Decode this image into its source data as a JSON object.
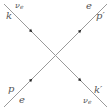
{
  "diagram": {
    "type": "feynman-diagram",
    "title": "",
    "vertex": {
      "x": 55.5,
      "y": 55.5
    },
    "line_color": "#9a9a9a",
    "arrow_color": "#222222",
    "label_color": "#555555",
    "external_lines": [
      {
        "id": "incoming-neutrino",
        "particle": "νe",
        "momentum": "k",
        "from": [
          4,
          4
        ],
        "to": [
          55.5,
          55.5
        ],
        "arrow_at": [
          31,
          31
        ],
        "arrow_direction": "toward-vertex"
      },
      {
        "id": "outgoing-electron",
        "particle": "e",
        "momentum": "p′",
        "from": [
          55.5,
          55.5
        ],
        "to": [
          107,
          4
        ],
        "arrow_at": [
          80,
          30
        ],
        "arrow_direction": "away-from-vertex"
      },
      {
        "id": "incoming-electron",
        "particle": "e",
        "momentum": "p",
        "from": [
          4,
          107
        ],
        "to": [
          55.5,
          55.5
        ],
        "arrow_at": [
          31,
          80
        ],
        "arrow_direction": "toward-vertex"
      },
      {
        "id": "outgoing-neutrino",
        "particle": "νe",
        "momentum": "k′",
        "from": [
          55.5,
          55.5
        ],
        "to": [
          107,
          107
        ],
        "arrow_at": [
          80,
          80
        ],
        "arrow_direction": "away-from-vertex"
      }
    ]
  },
  "labels": {
    "top_left_particle": {
      "base": "ν",
      "sub": "e"
    },
    "top_left_momentum": "k",
    "top_right_particle": "e",
    "top_right_momentum": "p′",
    "bottom_left_momentum": "p",
    "bottom_left_particle": "e",
    "bottom_right_momentum": "k′",
    "bottom_right_particle": {
      "base": "ν",
      "sub": "e"
    }
  }
}
